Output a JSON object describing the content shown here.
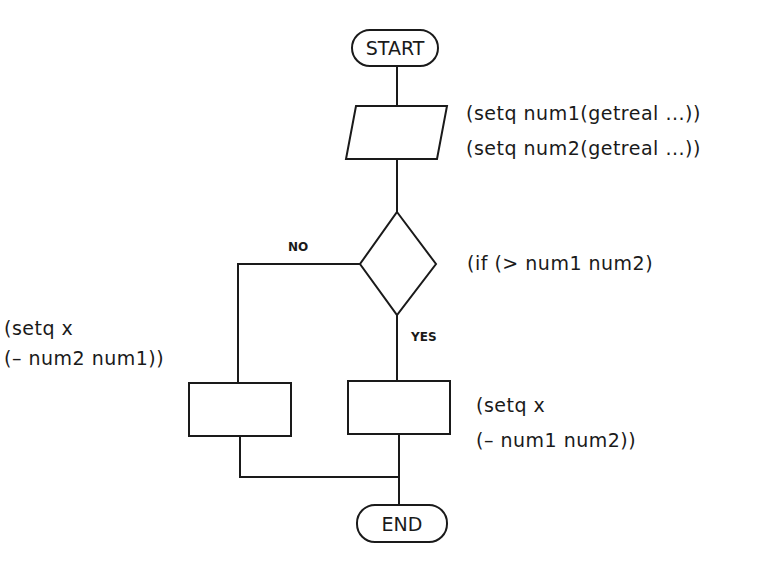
{
  "diagram": {
    "type": "flowchart",
    "nodes": {
      "start": {
        "shape": "terminator",
        "label": "START"
      },
      "input": {
        "shape": "parallelogram",
        "lines": [
          "(setq  num1(getreal  ...))",
          "(setq  num2(getreal  ...))"
        ]
      },
      "decision": {
        "shape": "diamond",
        "label": "(if  (>  num1  num2)"
      },
      "no_branch": {
        "shape": "process",
        "lines": [
          "(setq  x",
          "(–  num2  num1))"
        ]
      },
      "yes_branch": {
        "shape": "process",
        "lines": [
          "(setq  x",
          "(–  num1  num2))"
        ]
      },
      "end": {
        "shape": "terminator",
        "label": "END"
      }
    },
    "edge_labels": {
      "no": "NO",
      "yes": "YES"
    },
    "colors": {
      "stroke": "#1a1a1a",
      "background": "#ffffff"
    }
  }
}
